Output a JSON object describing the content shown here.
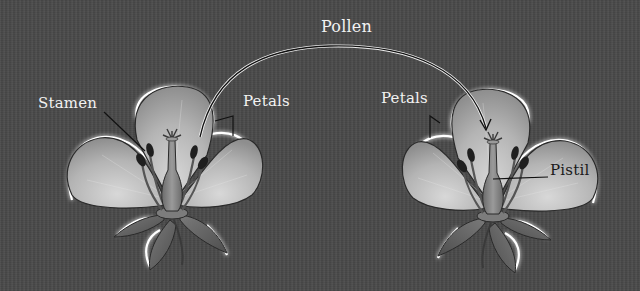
{
  "diagram": {
    "background_color": "#4a4a4a",
    "petal_color": "#bdbdbd",
    "outline_glow_color": "#ffffff",
    "labels": {
      "pollen": "Pollen",
      "stamen": "Stamen",
      "petals_left": "Petals",
      "petals_right": "Petals",
      "pistil": "Pistil"
    },
    "flowers": [
      {
        "name": "source-flower",
        "position": "left",
        "labeled_parts": [
          "Stamen",
          "Petals"
        ]
      },
      {
        "name": "target-flower",
        "position": "right",
        "labeled_parts": [
          "Petals",
          "Pistil"
        ]
      }
    ],
    "arrow": {
      "from": "source-flower stamen",
      "to": "target-flower pistil",
      "label": "Pollen"
    }
  }
}
